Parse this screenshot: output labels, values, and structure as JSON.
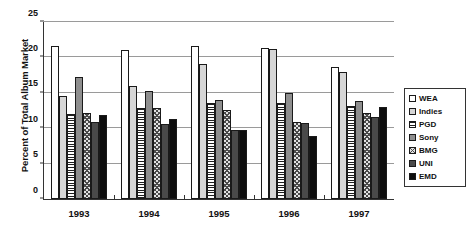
{
  "chart_data": {
    "type": "bar",
    "title": "",
    "xlabel": "",
    "ylabel": "Percent of Total Album Market",
    "ylim": [
      0,
      25
    ],
    "yticks": [
      0,
      5,
      10,
      15,
      20,
      25
    ],
    "grid": true,
    "legend_position": "right",
    "categories": [
      "1993",
      "1994",
      "1995",
      "1996",
      "1997"
    ],
    "series": [
      {
        "name": "WEA",
        "fill": "f-white",
        "values": [
          21.6,
          21.1,
          21.6,
          21.3,
          18.6
        ]
      },
      {
        "name": "Indies",
        "fill": "f-lightgray",
        "values": [
          14.5,
          16.0,
          19.1,
          21.2,
          18.0
        ]
      },
      {
        "name": "PGD",
        "fill": "f-hlines",
        "values": [
          12.0,
          12.8,
          13.5,
          13.6,
          13.2
        ]
      },
      {
        "name": "Sony",
        "fill": "f-medgray",
        "values": [
          17.3,
          15.3,
          14.0,
          15.0,
          13.8
        ]
      },
      {
        "name": "BMG",
        "fill": "f-hatch",
        "values": [
          12.1,
          12.8,
          12.6,
          10.9,
          12.2
        ]
      },
      {
        "name": "UNI",
        "fill": "f-darkgray",
        "values": [
          10.9,
          10.6,
          9.8,
          10.7,
          11.6
        ]
      },
      {
        "name": "EMD",
        "fill": "f-black",
        "values": [
          11.8,
          11.3,
          9.8,
          8.9,
          13.0
        ]
      }
    ]
  },
  "axis": {
    "y_title": "Percent of Total Album Market"
  },
  "colors": {
    "axis": "#333333",
    "gridline": "#9a9a9a",
    "bar_outline": "#1a1a1a",
    "text": "#111111",
    "background": "#ffffff"
  }
}
